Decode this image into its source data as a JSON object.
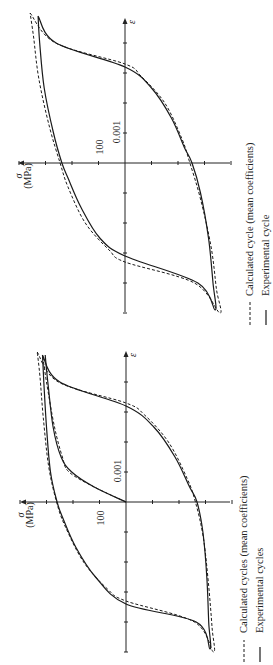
{
  "chart_data": [
    {
      "type": "line",
      "title": "",
      "orientation": "rotated 90 degrees counter-clockwise (sigma axis horizontal, increasing leftward; epsilon axis vertical, increasing upward)",
      "xlabel": "ε",
      "ylabel": "σ (MPa)",
      "x_tick_label": "0.001",
      "y_tick_label": "100",
      "x_tick_step": 0.001,
      "y_tick_step": 100,
      "xlim": [
        -0.005,
        0.005
      ],
      "ylim": [
        -400,
        400
      ],
      "grid": false,
      "legend_position": "right (reads vertically)",
      "legend": [
        {
          "style": "dashed",
          "label": "Calculated cycle (mean coefficients)"
        },
        {
          "style": "solid",
          "label": "Experimental cycle"
        }
      ],
      "series": [
        {
          "name": "Experimental cycle",
          "style": "solid",
          "points": [
            [
              0.0049,
              328
            ],
            [
              0.004,
              260
            ],
            [
              0.0032,
              0
            ],
            [
              0.0025,
              -100
            ],
            [
              0.0015,
              -175
            ],
            [
              0.0005,
              -225
            ],
            [
              0.0,
              -253
            ],
            [
              -0.001,
              -285
            ],
            [
              -0.0025,
              -315
            ],
            [
              -0.004,
              -332
            ],
            [
              -0.0049,
              -340
            ],
            [
              -0.004,
              -275
            ],
            [
              -0.0031,
              0
            ],
            [
              -0.0025,
              95
            ],
            [
              -0.0015,
              165
            ],
            [
              -0.0005,
              215
            ],
            [
              0.0,
              238
            ],
            [
              0.001,
              270
            ],
            [
              0.0025,
              305
            ],
            [
              0.004,
              322
            ],
            [
              0.0049,
              328
            ]
          ]
        },
        {
          "name": "Calculated cycle (mean coefficients)",
          "style": "dashed",
          "points": [
            [
              0.005,
              358
            ],
            [
              0.004,
              262
            ],
            [
              0.0033,
              0
            ],
            [
              0.0029,
              -60
            ],
            [
              0.002,
              -150
            ],
            [
              0.0008,
              -215
            ],
            [
              0.0,
              -245
            ],
            [
              -0.0012,
              -285
            ],
            [
              -0.0028,
              -325
            ],
            [
              -0.0042,
              -345
            ],
            [
              -0.005,
              -358
            ],
            [
              -0.004,
              -262
            ],
            [
              -0.0033,
              0
            ],
            [
              -0.0029,
              60
            ],
            [
              -0.002,
              150
            ],
            [
              -0.0008,
              215
            ],
            [
              0.0,
              245
            ],
            [
              0.0012,
              285
            ],
            [
              0.0028,
              325
            ],
            [
              0.0042,
              345
            ],
            [
              0.005,
              358
            ]
          ]
        }
      ]
    },
    {
      "type": "line",
      "title": "",
      "orientation": "rotated 90 degrees counter-clockwise (sigma axis horizontal, increasing leftward; epsilon axis vertical, increasing upward)",
      "xlabel": "ε",
      "ylabel": "σ (MPa)",
      "x_tick_label": "0.001",
      "y_tick_label": "100",
      "x_tick_step": 0.001,
      "y_tick_step": 100,
      "xlim": [
        -0.005,
        0.005
      ],
      "ylim": [
        -400,
        400
      ],
      "grid": false,
      "legend_position": "right (reads vertically)",
      "legend": [
        {
          "style": "dashed",
          "label": "Calculated cycles (mean coefficients)"
        },
        {
          "style": "solid",
          "label": "Experimental cycles"
        }
      ],
      "series": [
        {
          "name": "Experimental cycles (initial loading)",
          "style": "solid",
          "points": [
            [
              0.0,
              0
            ],
            [
              0.0005,
              120
            ],
            [
              0.001,
              205
            ],
            [
              0.0015,
              245
            ],
            [
              0.0025,
              275
            ],
            [
              0.004,
              295
            ],
            [
              0.0049,
              305
            ]
          ]
        },
        {
          "name": "Experimental cycles (stabilised loop)",
          "style": "solid",
          "points": [
            [
              0.0049,
              315
            ],
            [
              0.004,
              250
            ],
            [
              0.0032,
              0
            ],
            [
              0.0025,
              -105
            ],
            [
              0.0015,
              -185
            ],
            [
              0.0005,
              -240
            ],
            [
              0.0,
              -268
            ],
            [
              -0.001,
              -290
            ],
            [
              -0.0025,
              -305
            ],
            [
              -0.004,
              -312
            ],
            [
              -0.0049,
              -317
            ],
            [
              -0.004,
              -265
            ],
            [
              -0.0034,
              0
            ],
            [
              -0.0025,
              115
            ],
            [
              -0.0015,
              190
            ],
            [
              -0.0005,
              240
            ],
            [
              0.0,
              260
            ],
            [
              0.001,
              285
            ],
            [
              0.0025,
              300
            ],
            [
              0.004,
              310
            ],
            [
              0.0049,
              315
            ]
          ]
        },
        {
          "name": "Calculated cycles (initial loading)",
          "style": "dashed",
          "points": [
            [
              0.0,
              0
            ],
            [
              0.0005,
              120
            ],
            [
              0.001,
              215
            ],
            [
              0.0015,
              240
            ],
            [
              0.0025,
              270
            ],
            [
              0.004,
              300
            ],
            [
              0.0049,
              315
            ]
          ]
        },
        {
          "name": "Calculated cycles (stabilised loop)",
          "style": "dashed",
          "points": [
            [
              0.005,
              335
            ],
            [
              0.004,
              255
            ],
            [
              0.0033,
              0
            ],
            [
              0.0029,
              -70
            ],
            [
              0.002,
              -160
            ],
            [
              0.0008,
              -230
            ],
            [
              0.0,
              -262
            ],
            [
              -0.0012,
              -292
            ],
            [
              -0.0028,
              -312
            ],
            [
              -0.0042,
              -325
            ],
            [
              -0.005,
              -330
            ],
            [
              -0.004,
              -258
            ],
            [
              -0.0033,
              0
            ],
            [
              -0.0029,
              70
            ],
            [
              -0.002,
              160
            ],
            [
              -0.0008,
              230
            ],
            [
              0.0,
              262
            ],
            [
              0.0012,
              292
            ],
            [
              0.0028,
              312
            ],
            [
              0.0042,
              325
            ],
            [
              0.005,
              335
            ]
          ]
        }
      ]
    }
  ],
  "panels": {
    "top": {
      "axis_sigma_symbol": "σ",
      "axis_sigma_unit": "(MPa)",
      "axis_epsilon_symbol": "ε",
      "tick_label_sigma": "100",
      "tick_label_epsilon": "0.001",
      "legend_dashed": "Calculated cycle (mean coefficients)",
      "legend_solid": "Experimental cycle"
    },
    "bottom": {
      "axis_sigma_symbol": "σ",
      "axis_sigma_unit": "(MPa)",
      "axis_epsilon_symbol": "ε",
      "tick_label_sigma": "100",
      "tick_label_epsilon": "0.001",
      "legend_dashed": "Calculated cycles (mean coefficients)",
      "legend_solid": "Experimental cycles"
    }
  }
}
